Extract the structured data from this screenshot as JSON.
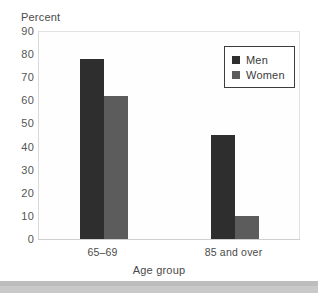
{
  "chart_data": {
    "type": "bar",
    "title": "",
    "categories": [
      "65–69",
      "85 and over"
    ],
    "series": [
      {
        "name": "Men",
        "values": [
          78,
          45
        ],
        "color": "#2e2e2e"
      },
      {
        "name": "Women",
        "values": [
          62,
          10
        ],
        "color": "#5c5c5c"
      }
    ],
    "xlabel": "Age group",
    "ylabel": "Percent",
    "ylim": [
      0,
      90
    ],
    "ytick_labels": [
      "0",
      "10",
      "20",
      "30",
      "40",
      "50",
      "60",
      "70",
      "80",
      "90"
    ],
    "ytick_values": [
      0,
      10,
      20,
      30,
      40,
      50,
      60,
      70,
      80,
      90
    ],
    "grid": false,
    "legend_position": "top-right",
    "legend_entries": [
      "Men",
      "Women"
    ]
  },
  "axes": {
    "y_axis_label": "Percent",
    "x_axis_label": "Age group"
  },
  "colors": {
    "men": "#2e2e2e",
    "women": "#5c5c5c",
    "plot_border": "#e2e2e2",
    "legend_border": "#3d3d3d",
    "text": "#4a4a4a",
    "bottom_strip": "#c9c9c9"
  }
}
